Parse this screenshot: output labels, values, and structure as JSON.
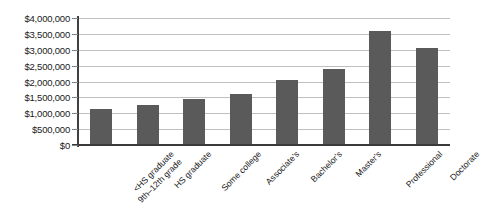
{
  "chart_data": {
    "type": "bar",
    "title": "",
    "xlabel": "",
    "ylabel": "",
    "categories": [
      "<HS graduate\n9th–12th grade",
      "HS graduate",
      "Some college",
      "Associate's",
      "Bachelor's",
      "Master's",
      "Professional",
      "Doctorate"
    ],
    "category_lines": [
      [
        "<HS graduate",
        "9th–12th grade"
      ],
      [
        "HS graduate"
      ],
      [
        "Some college"
      ],
      [
        "Associate's"
      ],
      [
        "Bachelor's"
      ],
      [
        "Master's"
      ],
      [
        "Professional"
      ],
      [
        "Doctorate"
      ]
    ],
    "values": [
      1150000,
      1250000,
      1450000,
      1600000,
      2050000,
      2400000,
      3600000,
      3050000
    ],
    "ylim": [
      0,
      4000000
    ],
    "ytick_values": [
      0,
      500000,
      1000000,
      1500000,
      2000000,
      2500000,
      3000000,
      3500000,
      4000000
    ],
    "ytick_labels": [
      "$0",
      "$500,000",
      "$1,000,000",
      "$1,500,000",
      "$2,000,000",
      "$2,500,000",
      "$3,000,000",
      "$3,500,000",
      "$4,000,000"
    ],
    "grid": true,
    "legend": false,
    "legend_position": "none",
    "bar_color": "#5a5a5a",
    "gridline_color": "#bfbfbf",
    "axis_color": "#3a3a3a",
    "background_color": "#ffffff"
  }
}
